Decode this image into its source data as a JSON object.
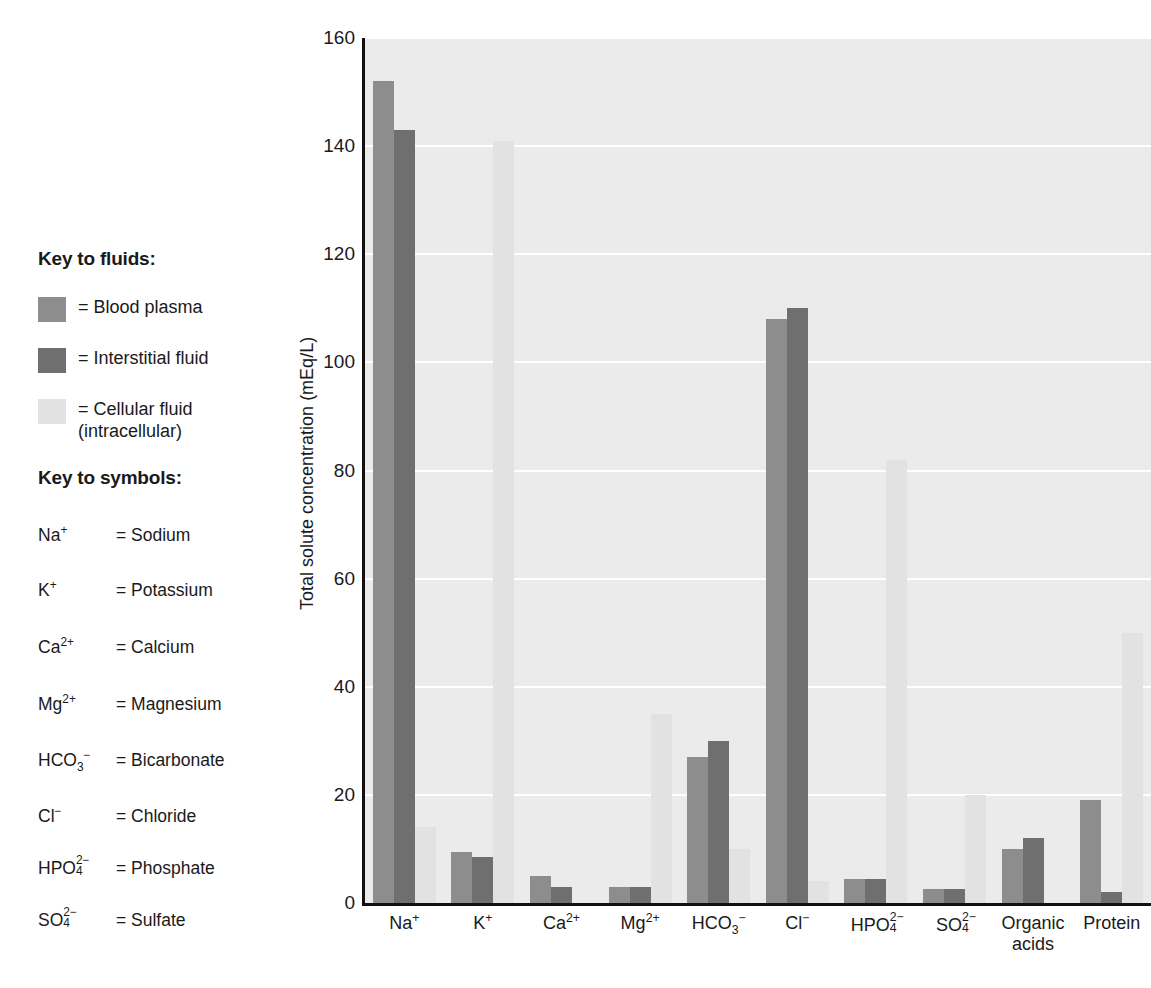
{
  "key_to_fluids": {
    "heading": "Key to fluids:",
    "items": [
      {
        "label": "= Blood plasma",
        "color": "#8d8d8d",
        "series": "plasma"
      },
      {
        "label": "= Interstitial fluid",
        "color": "#6f6f6f",
        "series": "interstitial"
      },
      {
        "label": "= Cellular fluid\n(intracellular)",
        "color": "#e2e2e2",
        "series": "cellular"
      }
    ]
  },
  "key_to_symbols": {
    "heading": "Key to symbols:",
    "items": [
      {
        "formula_html": "Na<sup>+</sup>",
        "definition": "= Sodium"
      },
      {
        "formula_html": "K<sup>+</sup>",
        "definition": "= Potassium"
      },
      {
        "formula_html": "Ca<sup>2+</sup>",
        "definition": "= Calcium"
      },
      {
        "formula_html": "Mg<sup>2+</sup>",
        "definition": "= Magnesium"
      },
      {
        "formula_html": "HCO<sub>3</sub><sup>−</sup>",
        "definition": "= Bicarbonate"
      },
      {
        "formula_html": "Cl<sup>−</sup>",
        "definition": "= Chloride"
      },
      {
        "formula_html": "HPO<span class=\"supsub\"><span class=\"s-up\">2−</span><span class=\"s-dn\">4</span></span>",
        "definition": "= Phosphate"
      },
      {
        "formula_html": "SO<span class=\"supsub\"><span class=\"s-up\">2−</span><span class=\"s-dn\">4</span></span>",
        "definition": "= Sulfate"
      }
    ]
  },
  "chart_data": {
    "type": "bar",
    "title": "",
    "xlabel": "",
    "ylabel": "Total solute concentration (mEq/L)",
    "ylim": [
      0,
      160
    ],
    "yticks": [
      0,
      20,
      40,
      60,
      80,
      100,
      120,
      140,
      160
    ],
    "grid": true,
    "legend_position": "external-left",
    "categories": [
      "Na+",
      "K+",
      "Ca2+",
      "Mg2+",
      "HCO3-",
      "Cl-",
      "HPO4 2-",
      "SO4 2-",
      "Organic acids",
      "Protein"
    ],
    "category_labels_html": [
      "Na<sup>+</sup>",
      "K<sup>+</sup>",
      "Ca<sup>2+</sup>",
      "Mg<sup>2+</sup>",
      "HCO<sub>3</sub><sup>−</sup>",
      "Cl<sup>−</sup>",
      "HPO<span class=\"supsub\"><span class=\"s-up\">2−</span><span class=\"s-dn\">4</span></span>",
      "SO<span class=\"supsub\"><span class=\"s-up\">2−</span><span class=\"s-dn\">4</span></span>",
      "Organic<br>acids",
      "Protein"
    ],
    "series": [
      {
        "name": "Blood plasma",
        "color": "#8d8d8d",
        "values": [
          152,
          9.5,
          5,
          3,
          27,
          108,
          4.5,
          2.5,
          10,
          19
        ]
      },
      {
        "name": "Interstitial fluid",
        "color": "#6f6f6f",
        "values": [
          143,
          8.5,
          3,
          3,
          30,
          110,
          4.5,
          2.5,
          12,
          2
        ]
      },
      {
        "name": "Cellular fluid (intracellular)",
        "color": "#e2e2e2",
        "values": [
          14,
          141,
          0,
          35,
          10,
          4,
          82,
          20,
          0,
          50
        ]
      }
    ]
  },
  "axis": {
    "y_title": "Total solute concentration (mEq/L)"
  }
}
